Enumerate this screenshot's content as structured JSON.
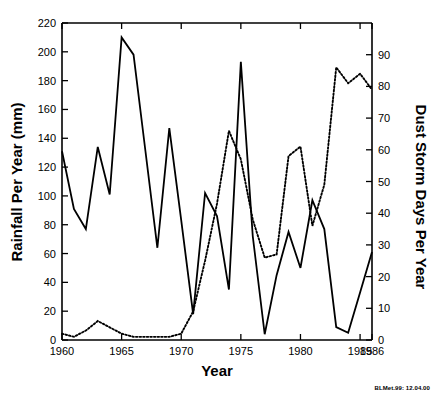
{
  "figure": {
    "credit": "BLMet.99: 12.04.00"
  },
  "chart_data": {
    "type": "line",
    "title": "",
    "xlabel": "Year",
    "ylabel": "Rainfall Per Year (mm)",
    "y2label": "Dust Storm Days Per Year",
    "xlim": [
      1960,
      1986
    ],
    "ylim": [
      0,
      220
    ],
    "y2lim": [
      0,
      100
    ],
    "xticks": [
      1960,
      1965,
      1970,
      1975,
      1980,
      1985,
      1986
    ],
    "xticklabels": [
      "1960",
      "1965",
      "1970",
      "1975",
      "1980",
      "1985",
      "1986"
    ],
    "yticks": [
      0,
      20,
      40,
      60,
      80,
      100,
      120,
      140,
      160,
      180,
      200,
      220
    ],
    "yticklabels": [
      "0",
      "20",
      "40",
      "60",
      "80",
      "100",
      "120",
      "140",
      "160",
      "180",
      "200",
      "220"
    ],
    "y2ticks": [
      0,
      10,
      20,
      30,
      40,
      50,
      60,
      70,
      80,
      90
    ],
    "y2ticklabels": [
      "0",
      "10",
      "20",
      "30",
      "40",
      "50",
      "60",
      "70",
      "80",
      "90"
    ],
    "grid": false,
    "legend": "none",
    "x": [
      1960,
      1961,
      1962,
      1963,
      1964,
      1965,
      1966,
      1967,
      1968,
      1969,
      1970,
      1971,
      1972,
      1973,
      1974,
      1975,
      1976,
      1977,
      1978,
      1979,
      1980,
      1981,
      1982,
      1983,
      1984,
      1985,
      1986
    ],
    "series": [
      {
        "name": "Rainfall Per Year (mm)",
        "axis": "left",
        "style": "solid",
        "units": "mm",
        "values": [
          131,
          91,
          77,
          134,
          101,
          210,
          198,
          131,
          64,
          147,
          83,
          18,
          102,
          86,
          35,
          193,
          72,
          4,
          45,
          75,
          50,
          97,
          77,
          9,
          5,
          33,
          61
        ]
      },
      {
        "name": "Dust Storm Days Per Year",
        "axis": "right",
        "style": "dotted",
        "units": "days",
        "values": [
          2,
          1,
          3,
          6,
          4,
          2,
          1,
          1,
          1,
          1,
          2,
          9,
          25,
          43,
          66,
          57,
          38,
          26,
          27,
          58,
          61,
          36,
          49,
          86,
          81,
          84,
          79
        ]
      }
    ]
  }
}
